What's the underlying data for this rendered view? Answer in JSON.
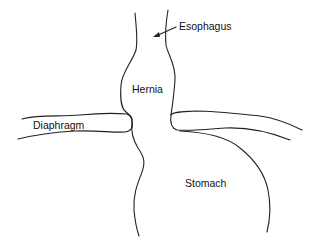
{
  "diagram": {
    "labels": {
      "esophagus": "Esophagus",
      "hernia": "Hernia",
      "diaphragm": "Diaphragm",
      "stomach": "Stomach"
    },
    "colors": {
      "stroke": "#222222",
      "text": "#111111",
      "background": "#ffffff"
    }
  }
}
